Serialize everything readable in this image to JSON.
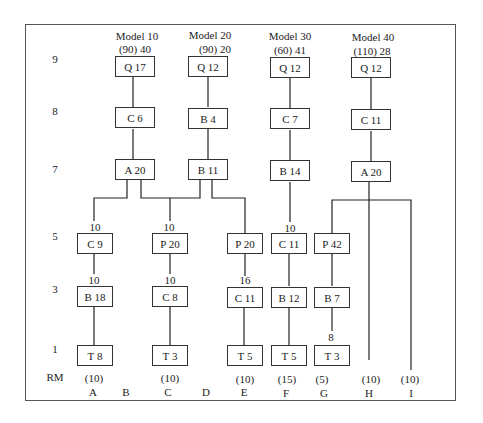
{
  "diagram": {
    "type": "product-structure",
    "level_labels": [
      "9",
      "8",
      "7",
      "5",
      "3",
      "1",
      "RM"
    ],
    "models": [
      {
        "name": "Model 10",
        "qty": "(90) 40"
      },
      {
        "name": "Model 20",
        "qty": "(90) 20"
      },
      {
        "name": "Model 30",
        "qty": "(60) 41"
      },
      {
        "name": "Model 40",
        "qty": "(110) 28"
      }
    ],
    "nodes": {
      "m10_q": "Q 17",
      "m10_c": "C 6",
      "m10_a": "A 20",
      "m20_q": "Q 12",
      "m20_b": "B 4",
      "m20_b11": "B 11",
      "m30_q": "Q 12",
      "m30_c": "C 7",
      "m30_b": "B 14",
      "m40_q": "Q 12",
      "m40_c": "C 11",
      "m40_a": "A 20",
      "l5": [
        "C  9",
        "P 20",
        "P 20",
        "C 11",
        "P 42"
      ],
      "l3": [
        "B 18",
        "C  8",
        "C 11",
        "B 12",
        "B  7"
      ],
      "l1": [
        "T  8",
        "T  3",
        "T  5",
        "T  5",
        "T  3"
      ]
    },
    "edge_labels": {
      "a_l5": "10",
      "c_l5": "10",
      "f_l5": "10",
      "a_l3": "10",
      "c_l3": "10",
      "e_l3": "16",
      "g_l1": "8"
    },
    "rm": [
      "(10)",
      "",
      "(10)",
      "",
      "(10)",
      "(15)",
      "(5)",
      "(10)",
      "(10)"
    ],
    "columns": [
      "A",
      "B",
      "C",
      "D",
      "E",
      "F",
      "G",
      "H",
      "I"
    ]
  }
}
